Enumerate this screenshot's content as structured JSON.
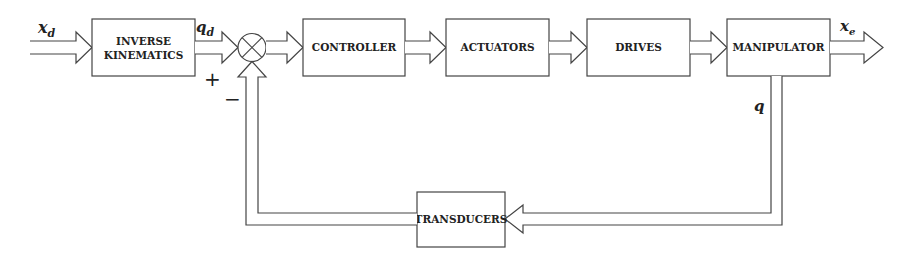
{
  "diagram": {
    "type": "block-diagram",
    "title": "",
    "blocks": [
      {
        "id": "inverse-kinematics",
        "lines": [
          "INVERSE",
          "KINEMATICS"
        ]
      },
      {
        "id": "controller",
        "lines": [
          "CONTROLLER"
        ]
      },
      {
        "id": "actuators",
        "lines": [
          "ACTUATORS"
        ]
      },
      {
        "id": "drives",
        "lines": [
          "DRIVES"
        ]
      },
      {
        "id": "manipulator",
        "lines": [
          "MANIPULATOR"
        ]
      },
      {
        "id": "transducers",
        "lines": [
          "TRANSDUCERS"
        ]
      }
    ],
    "summing_junction": {
      "plus_sign": "+",
      "minus_sign": "−"
    },
    "signals": {
      "input": {
        "symbol": "x",
        "subscript": "d"
      },
      "reference_joint": {
        "symbol": "q",
        "subscript": "d"
      },
      "output": {
        "symbol": "x",
        "subscript": "e"
      },
      "feedback": {
        "symbol": "q",
        "subscript": ""
      }
    },
    "connections": [
      {
        "from": "input",
        "to": "inverse-kinematics",
        "label": "x_d"
      },
      {
        "from": "inverse-kinematics",
        "to": "summing-junction",
        "label": "q_d",
        "sign": "+"
      },
      {
        "from": "summing-junction",
        "to": "controller"
      },
      {
        "from": "controller",
        "to": "actuators"
      },
      {
        "from": "actuators",
        "to": "drives"
      },
      {
        "from": "drives",
        "to": "manipulator"
      },
      {
        "from": "manipulator",
        "to": "output",
        "label": "x_e"
      },
      {
        "from": "manipulator",
        "to": "transducers",
        "label": "q"
      },
      {
        "from": "transducers",
        "to": "summing-junction",
        "sign": "−"
      }
    ],
    "colors": {
      "stroke": "#444444",
      "text": "#222222",
      "background": "#ffffff"
    }
  }
}
